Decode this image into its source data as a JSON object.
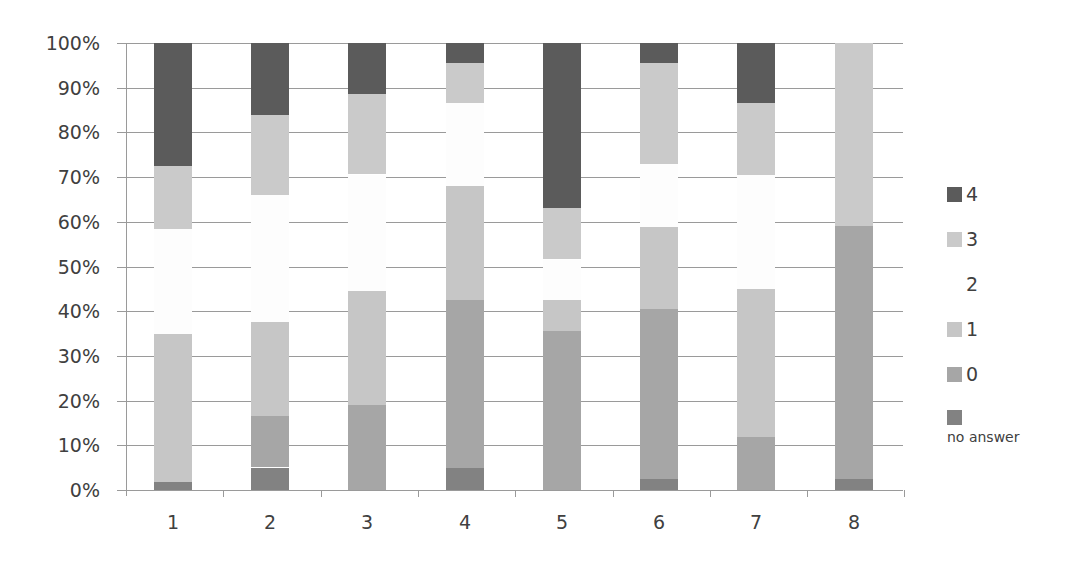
{
  "chart_data": {
    "type": "bar",
    "stacked": true,
    "percent": true,
    "title": "",
    "xlabel": "",
    "ylabel": "",
    "ylim": [
      0,
      100
    ],
    "yticks": [
      "0%",
      "10%",
      "20%",
      "30%",
      "40%",
      "50%",
      "60%",
      "70%",
      "80%",
      "90%",
      "100%"
    ],
    "grid": true,
    "legend_position": "right",
    "categories": [
      "1",
      "2",
      "3",
      "4",
      "5",
      "6",
      "7",
      "8"
    ],
    "series": [
      {
        "name": "no answer",
        "color": "#828282",
        "values": [
          2,
          5,
          0,
          5,
          0,
          2.5,
          0,
          2.5
        ]
      },
      {
        "name": "0",
        "color": "#a6a6a6",
        "values": [
          0,
          11.5,
          19,
          37.5,
          35.5,
          38,
          12,
          56.5
        ]
      },
      {
        "name": "1",
        "color": "#c6c6c6",
        "values": [
          33,
          21,
          25.5,
          25.5,
          7,
          18.5,
          33,
          0
        ]
      },
      {
        "name": "2",
        "color": "#fdfdfd",
        "values": [
          23.5,
          28.5,
          26,
          18.5,
          9,
          14,
          25.5,
          0
        ]
      },
      {
        "name": "3",
        "color": "#cacaca",
        "values": [
          14,
          18,
          18,
          9,
          11.5,
          22.5,
          16,
          41
        ]
      },
      {
        "name": "4",
        "color": "#5b5b5b",
        "values": [
          27.5,
          16,
          11.5,
          4.5,
          37,
          4.5,
          13.5,
          0
        ]
      }
    ]
  },
  "legend": {
    "items": [
      {
        "label": "4",
        "color": "#5b5b5b"
      },
      {
        "label": "3",
        "color": "#cacaca"
      },
      {
        "label": "2",
        "color": "#ffffff"
      },
      {
        "label": "1",
        "color": "#c6c6c6"
      },
      {
        "label": "0",
        "color": "#a6a6a6"
      },
      {
        "label": "no answer",
        "color": "#828282"
      }
    ]
  }
}
